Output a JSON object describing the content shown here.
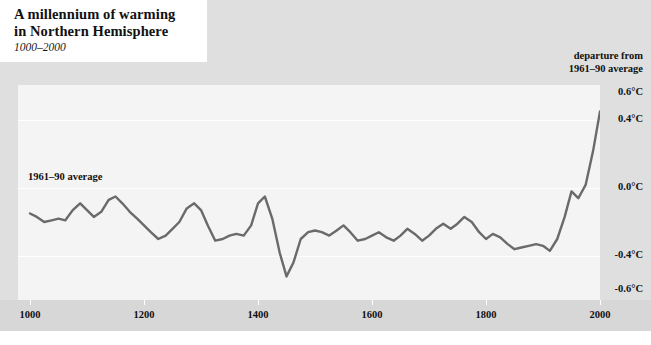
{
  "title": {
    "line1": "A millennium of warming",
    "line2": "in Northern Hemisphere",
    "subtitle": "1000–2000"
  },
  "axis_header": {
    "line1": "departure from",
    "line2": "1961–90 average"
  },
  "annotation": "1961–90 average",
  "colors": {
    "line": "#6a6a6a",
    "plot_background": "#f4f4f4",
    "frame": "#dfdfdf",
    "axis_band": "#d7d7d7",
    "gridline": "#ffffff",
    "text": "#111111"
  },
  "chart_data": {
    "type": "line",
    "title": "A millennium of warming in Northern Hemisphere",
    "subtitle": "1000–2000",
    "xlabel": "",
    "ylabel": "departure from 1961–90 average",
    "xlim": [
      1000,
      2000
    ],
    "ylim": [
      -0.7,
      0.65
    ],
    "grid": true,
    "legend": false,
    "xticks": [
      1000,
      1200,
      1400,
      1600,
      1800,
      2000
    ],
    "xticklabels": [
      "1000",
      "1200",
      "1400",
      "1600",
      "1800",
      "2000"
    ],
    "yticks": [
      0.6,
      0.4,
      0.0,
      -0.4,
      -0.6
    ],
    "yticklabels": [
      "0.6°C",
      "0.4°C",
      "0.0°C",
      "-0.4°C",
      "-0.6°C"
    ],
    "gridlines_at": [
      0.4,
      0.0,
      -0.4
    ],
    "series": [
      {
        "name": "Northern Hemisphere temperature anomaly",
        "color": "#6a6a6a",
        "x": [
          1000,
          1012,
          1025,
          1038,
          1050,
          1062,
          1075,
          1088,
          1100,
          1112,
          1125,
          1138,
          1150,
          1162,
          1175,
          1188,
          1200,
          1212,
          1225,
          1238,
          1250,
          1262,
          1275,
          1288,
          1300,
          1312,
          1325,
          1338,
          1350,
          1362,
          1375,
          1388,
          1400,
          1412,
          1425,
          1438,
          1450,
          1462,
          1475,
          1488,
          1500,
          1512,
          1525,
          1538,
          1550,
          1562,
          1575,
          1588,
          1600,
          1612,
          1625,
          1638,
          1650,
          1662,
          1675,
          1688,
          1700,
          1712,
          1725,
          1738,
          1750,
          1762,
          1775,
          1788,
          1800,
          1812,
          1825,
          1838,
          1850,
          1862,
          1875,
          1888,
          1900,
          1912,
          1925,
          1938,
          1950,
          1962,
          1975,
          1988,
          2000
        ],
        "y": [
          -0.15,
          -0.17,
          -0.2,
          -0.19,
          -0.18,
          -0.19,
          -0.13,
          -0.09,
          -0.13,
          -0.17,
          -0.14,
          -0.07,
          -0.05,
          -0.09,
          -0.14,
          -0.18,
          -0.22,
          -0.26,
          -0.3,
          -0.28,
          -0.24,
          -0.2,
          -0.12,
          -0.09,
          -0.13,
          -0.22,
          -0.31,
          -0.3,
          -0.28,
          -0.27,
          -0.28,
          -0.22,
          -0.09,
          -0.05,
          -0.18,
          -0.38,
          -0.52,
          -0.44,
          -0.3,
          -0.26,
          -0.25,
          -0.26,
          -0.28,
          -0.25,
          -0.22,
          -0.26,
          -0.31,
          -0.3,
          -0.28,
          -0.26,
          -0.29,
          -0.31,
          -0.28,
          -0.24,
          -0.27,
          -0.31,
          -0.28,
          -0.24,
          -0.21,
          -0.24,
          -0.21,
          -0.17,
          -0.2,
          -0.26,
          -0.3,
          -0.27,
          -0.29,
          -0.33,
          -0.36,
          -0.35,
          -0.34,
          -0.33,
          -0.34,
          -0.37,
          -0.3,
          -0.17,
          -0.02,
          -0.06,
          0.02,
          0.22,
          0.45
        ]
      }
    ]
  }
}
